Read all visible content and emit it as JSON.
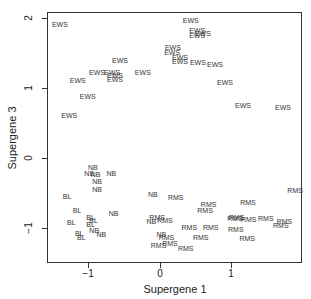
{
  "chart_data": {
    "type": "scatter",
    "title": "",
    "xlabel": "Supergene 1",
    "ylabel": "Supergene 3",
    "xlim": [
      -1.58,
      1.98
    ],
    "ylim": [
      -1.5,
      2.09
    ],
    "xticks": [
      -1,
      0,
      1
    ],
    "yticks": [
      -1,
      0,
      1,
      2
    ],
    "xtick_labels": [
      "−1",
      "0",
      "1"
    ],
    "ytick_labels": [
      "−1",
      "0",
      "1",
      "2"
    ],
    "grid": false,
    "legend": null,
    "marker": "text-label",
    "series": [
      {
        "name": "EWS",
        "points": [
          [
            -1.4,
            1.91
          ],
          [
            0.43,
            1.97
          ],
          [
            0.52,
            1.83
          ],
          [
            0.6,
            1.79
          ],
          [
            0.52,
            1.76
          ],
          [
            0.18,
            1.59
          ],
          [
            0.17,
            1.51
          ],
          [
            0.28,
            1.44
          ],
          [
            0.28,
            1.39
          ],
          [
            0.53,
            1.37
          ],
          [
            0.77,
            1.34
          ],
          [
            0.91,
            1.09
          ],
          [
            1.16,
            0.76
          ],
          [
            1.72,
            0.73
          ],
          [
            -0.56,
            1.4
          ],
          [
            -0.88,
            1.23
          ],
          [
            -0.67,
            1.23
          ],
          [
            -0.63,
            1.19
          ],
          [
            -0.63,
            1.13
          ],
          [
            -0.24,
            1.23
          ],
          [
            -1.15,
            1.11
          ],
          [
            -1.01,
            0.89
          ],
          [
            -1.27,
            0.61
          ]
        ]
      },
      {
        "name": "NB",
        "points": [
          [
            -0.94,
            -0.13
          ],
          [
            -0.99,
            -0.21
          ],
          [
            -0.9,
            -0.23
          ],
          [
            -0.68,
            -0.22
          ],
          [
            -0.88,
            -0.33
          ],
          [
            -0.88,
            -0.44
          ],
          [
            -0.1,
            -0.51
          ],
          [
            -0.65,
            -0.79
          ],
          [
            -0.92,
            -1.03
          ],
          [
            -0.82,
            -1.09
          ],
          [
            -0.12,
            -0.9
          ],
          [
            0.02,
            -1.09
          ]
        ]
      },
      {
        "name": "BL",
        "points": [
          [
            -1.3,
            -0.54
          ],
          [
            -1.16,
            -0.74
          ],
          [
            -0.97,
            -0.84
          ],
          [
            -0.93,
            -0.88
          ],
          [
            -1.24,
            -0.92
          ],
          [
            -0.97,
            -0.94
          ],
          [
            -1.13,
            -1.07
          ],
          [
            -1.1,
            -1.13
          ]
        ]
      },
      {
        "name": "RMS",
        "points": [
          [
            0.22,
            -0.56
          ],
          [
            0.68,
            -0.66
          ],
          [
            1.23,
            -0.63
          ],
          [
            1.89,
            -0.46
          ],
          [
            0.63,
            -0.74
          ],
          [
            1.07,
            -0.84
          ],
          [
            1.05,
            -0.86
          ],
          [
            1.24,
            -0.87
          ],
          [
            1.48,
            -0.86
          ],
          [
            1.74,
            -0.9
          ],
          [
            1.69,
            -0.95
          ],
          [
            0.07,
            -0.88
          ],
          [
            -0.04,
            -0.84
          ],
          [
            0.41,
            -0.98
          ],
          [
            0.71,
            -0.98
          ],
          [
            1.06,
            -1.01
          ],
          [
            0.09,
            -1.13
          ],
          [
            0.57,
            -1.13
          ],
          [
            1.22,
            -1.14
          ],
          [
            0.14,
            -1.21
          ],
          [
            0.36,
            -1.28
          ],
          [
            -0.02,
            -1.24
          ]
        ]
      }
    ]
  },
  "axes": {
    "xlabel": "Supergene 1",
    "ylabel": "Supergene 3"
  }
}
